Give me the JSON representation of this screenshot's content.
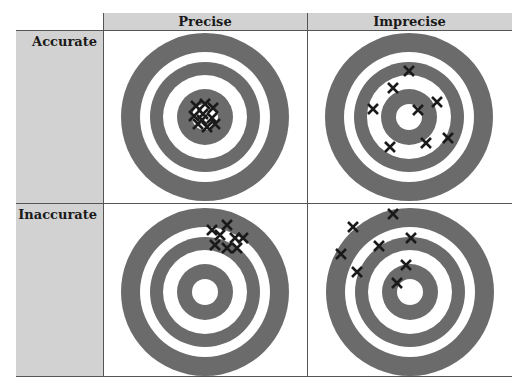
{
  "table": {
    "column_headers": [
      "Precise",
      "Imprecise"
    ],
    "row_headers": [
      "Accurate",
      "Inaccurate"
    ]
  },
  "colors": {
    "header_bg": "#d2d2d2",
    "ring": "#6b6b6b",
    "mark": "#1a1a1a",
    "border": "#555555"
  },
  "targets": [
    {
      "name": "accurate-precise",
      "center": [
        205,
        117
      ],
      "marks": [
        [
          196,
          106
        ],
        [
          205,
          104
        ],
        [
          213,
          108
        ],
        [
          194,
          116
        ],
        [
          203,
          114
        ],
        [
          212,
          118
        ],
        [
          198,
          124
        ],
        [
          207,
          127
        ],
        [
          215,
          124
        ],
        [
          202,
          120
        ]
      ]
    },
    {
      "name": "accurate-imprecise",
      "center": [
        409,
        117
      ],
      "marks": [
        [
          409,
          71
        ],
        [
          393,
          88
        ],
        [
          437,
          102
        ],
        [
          373,
          109
        ],
        [
          418,
          110
        ],
        [
          448,
          138
        ],
        [
          426,
          143
        ],
        [
          390,
          147
        ]
      ]
    },
    {
      "name": "inaccurate-precise",
      "center": [
        205,
        292
      ],
      "marks": [
        [
          227,
          225
        ],
        [
          212,
          230
        ],
        [
          220,
          235
        ],
        [
          235,
          238
        ],
        [
          243,
          238
        ],
        [
          215,
          245
        ],
        [
          227,
          248
        ],
        [
          237,
          248
        ]
      ]
    },
    {
      "name": "inaccurate-imprecise",
      "center": [
        410,
        292
      ],
      "marks": [
        [
          393,
          214
        ],
        [
          353,
          227
        ],
        [
          411,
          238
        ],
        [
          379,
          246
        ],
        [
          341,
          254
        ],
        [
          406,
          265
        ],
        [
          357,
          272
        ],
        [
          397,
          283
        ]
      ]
    }
  ]
}
